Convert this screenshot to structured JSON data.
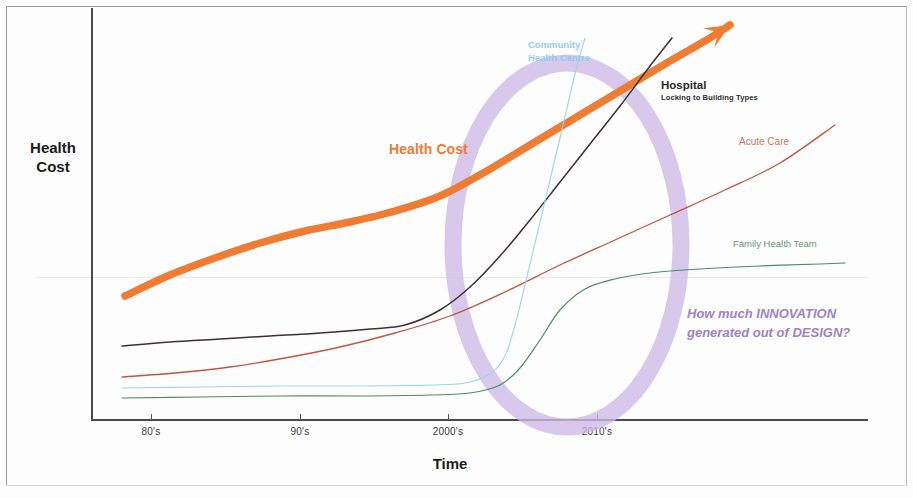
{
  "figure": {
    "axis_titles": {
      "y": "Health\nCost",
      "y_line1": "Health",
      "y_line2": "Cost",
      "x": "Time"
    },
    "annotations": {
      "health_cost": "Health Cost",
      "community_health_centre_line1": "Community",
      "community_health_centre_line2": "Health Centre",
      "hospital": "Hospital",
      "hospital_sub": "Locking to Building Types",
      "acute_care": "Acute Care",
      "family_health_team": "Family Health Team",
      "question_line1": "How much INNOVATION",
      "question_line2": "generated out of DESIGN?"
    },
    "colors": {
      "health_cost": "#f07b32",
      "hospital": "#3a3230",
      "acute_care": "#c0553f",
      "community_health_centre": "#9ed4ef",
      "family_health_team": "#4f8c63",
      "highlight_ellipse": "#cdb8e6",
      "question_text": "#9b84c4",
      "axis": "#4a4a4a"
    }
  },
  "chart_data": {
    "type": "line",
    "title": "",
    "xlabel": "Time",
    "ylabel": "Health Cost",
    "grid": true,
    "legend": "inline-annotations",
    "x_tick_labels": [
      "80's",
      "90's",
      "2000's",
      "2010's"
    ],
    "x_tick_positions_px": [
      151,
      300,
      448,
      597
    ],
    "xlim_px": [
      91,
      868
    ],
    "ylim_px": [
      419,
      8
    ],
    "series": [
      {
        "name": "Health Cost",
        "color": "#f07b32",
        "style": "thick-arrow",
        "description": "Steadily rising thick orange arrow from low-left to upper-right, ends in arrowhead",
        "points": [
          [
            125,
            296
          ],
          [
            170,
            275
          ],
          [
            215,
            258
          ],
          [
            260,
            243
          ],
          [
            305,
            231
          ],
          [
            350,
            222
          ],
          [
            395,
            211
          ],
          [
            440,
            196
          ],
          [
            485,
            172
          ],
          [
            530,
            145
          ],
          [
            575,
            118
          ],
          [
            620,
            91
          ],
          [
            665,
            64
          ],
          [
            710,
            38
          ],
          [
            730,
            25
          ]
        ]
      },
      {
        "name": "Hospital",
        "color": "#3a3230",
        "style": "thin",
        "description": "Flat then sharply exponential rise crossing all others, continues off top right",
        "points": [
          [
            122,
            346
          ],
          [
            170,
            342
          ],
          [
            220,
            339
          ],
          [
            270,
            336
          ],
          [
            320,
            333
          ],
          [
            370,
            329
          ],
          [
            405,
            325
          ],
          [
            440,
            310
          ],
          [
            470,
            287
          ],
          [
            500,
            256
          ],
          [
            530,
            220
          ],
          [
            560,
            182
          ],
          [
            590,
            144
          ],
          [
            620,
            106
          ],
          [
            650,
            66
          ],
          [
            672,
            38
          ]
        ]
      },
      {
        "name": "Acute Care",
        "color": "#c0553f",
        "style": "thin",
        "description": "Gently curving upward straight-ish line to upper right",
        "points": [
          [
            122,
            377
          ],
          [
            175,
            373
          ],
          [
            230,
            367
          ],
          [
            285,
            358
          ],
          [
            340,
            347
          ],
          [
            395,
            333
          ],
          [
            450,
            316
          ],
          [
            505,
            292
          ],
          [
            560,
            265
          ],
          [
            615,
            240
          ],
          [
            670,
            215
          ],
          [
            725,
            190
          ],
          [
            780,
            163
          ],
          [
            835,
            125
          ]
        ]
      },
      {
        "name": "Community Health Centre",
        "color": "#9ed4ef",
        "style": "thin",
        "description": "Flat near bottom then near-vertical S-rise after 2000's, continues off top",
        "points": [
          [
            122,
            388
          ],
          [
            200,
            387
          ],
          [
            280,
            386
          ],
          [
            360,
            386
          ],
          [
            430,
            385
          ],
          [
            465,
            383
          ],
          [
            490,
            374
          ],
          [
            505,
            356
          ],
          [
            515,
            325
          ],
          [
            525,
            285
          ],
          [
            537,
            235
          ],
          [
            550,
            180
          ],
          [
            563,
            125
          ],
          [
            576,
            70
          ],
          [
            585,
            38
          ]
        ]
      },
      {
        "name": "Family Health Team",
        "color": "#4f8c63",
        "style": "thin",
        "description": "Flat at bottom, S-curve rise around 2000's then plateaus just above gridline",
        "points": [
          [
            122,
            398
          ],
          [
            200,
            397
          ],
          [
            280,
            396
          ],
          [
            360,
            396
          ],
          [
            430,
            395
          ],
          [
            470,
            393
          ],
          [
            500,
            385
          ],
          [
            520,
            368
          ],
          [
            540,
            340
          ],
          [
            560,
            310
          ],
          [
            585,
            289
          ],
          [
            615,
            279
          ],
          [
            650,
            273
          ],
          [
            700,
            269
          ],
          [
            760,
            266
          ],
          [
            820,
            264
          ],
          [
            845,
            263
          ]
        ]
      }
    ],
    "highlight": {
      "type": "ellipse",
      "shape": "hollow ring",
      "color": "#cdb8e6",
      "cx_px": 567,
      "cy_px": 245,
      "rx_px": 114,
      "ry_px": 182,
      "stroke_width_px": 17
    }
  }
}
